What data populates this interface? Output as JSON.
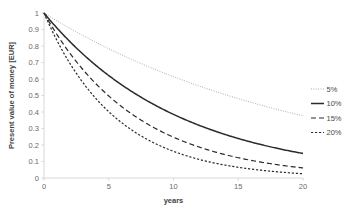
{
  "chart_data": {
    "type": "line",
    "title": "",
    "xlabel": "years",
    "ylabel": "Present value of money [EUR]",
    "xlim": [
      0,
      20
    ],
    "ylim": [
      0,
      1
    ],
    "grid": false,
    "legend_position": "right",
    "xticks": [
      "0",
      "5",
      "10",
      "15",
      "20"
    ],
    "xtick_values": [
      0,
      5,
      10,
      15,
      20
    ],
    "yticks": [
      "0",
      "0.1",
      "0.2",
      "0.3",
      "0.4",
      "0.5",
      "0.6",
      "0.7",
      "0.8",
      "0.9",
      "1"
    ],
    "ytick_values": [
      0,
      0.1,
      0.2,
      0.3,
      0.4,
      0.5,
      0.6,
      0.7,
      0.8,
      0.9,
      1
    ],
    "x": [
      0,
      1,
      2,
      3,
      4,
      5,
      6,
      7,
      8,
      9,
      10,
      11,
      12,
      13,
      14,
      15,
      16,
      17,
      18,
      19,
      20
    ],
    "series": [
      {
        "name": "5%",
        "rate": 0.05,
        "dash": "0.8,1.6",
        "width": 0.9,
        "color": "#8c8c8c",
        "values": [
          1,
          0.952,
          0.907,
          0.864,
          0.823,
          0.784,
          0.746,
          0.711,
          0.677,
          0.645,
          0.614,
          0.585,
          0.557,
          0.53,
          0.505,
          0.481,
          0.458,
          0.436,
          0.416,
          0.396,
          0.377
        ]
      },
      {
        "name": "10%",
        "rate": 0.1,
        "dash": "",
        "width": 1.5,
        "color": "#2b2b2b",
        "values": [
          1,
          0.909,
          0.826,
          0.751,
          0.683,
          0.621,
          0.564,
          0.513,
          0.467,
          0.424,
          0.386,
          0.35,
          0.319,
          0.29,
          0.263,
          0.239,
          0.218,
          0.198,
          0.18,
          0.164,
          0.149
        ]
      },
      {
        "name": "15%",
        "rate": 0.15,
        "dash": "5,3",
        "width": 1.2,
        "color": "#2b2b2b",
        "values": [
          1,
          0.87,
          0.756,
          0.658,
          0.572,
          0.497,
          0.432,
          0.376,
          0.327,
          0.284,
          0.247,
          0.215,
          0.187,
          0.163,
          0.141,
          0.123,
          0.107,
          0.093,
          0.081,
          0.07,
          0.061
        ]
      },
      {
        "name": "20%",
        "rate": 0.2,
        "dash": "2.2,1.8",
        "width": 1.2,
        "color": "#2b2b2b",
        "values": [
          1,
          0.833,
          0.694,
          0.579,
          0.482,
          0.402,
          0.335,
          0.279,
          0.233,
          0.194,
          0.162,
          0.135,
          0.112,
          0.093,
          0.078,
          0.065,
          0.054,
          0.045,
          0.038,
          0.031,
          0.026
        ]
      }
    ]
  },
  "legend": {
    "items": [
      {
        "label": "5%"
      },
      {
        "label": "10%"
      },
      {
        "label": "15%"
      },
      {
        "label": "20%"
      }
    ]
  }
}
